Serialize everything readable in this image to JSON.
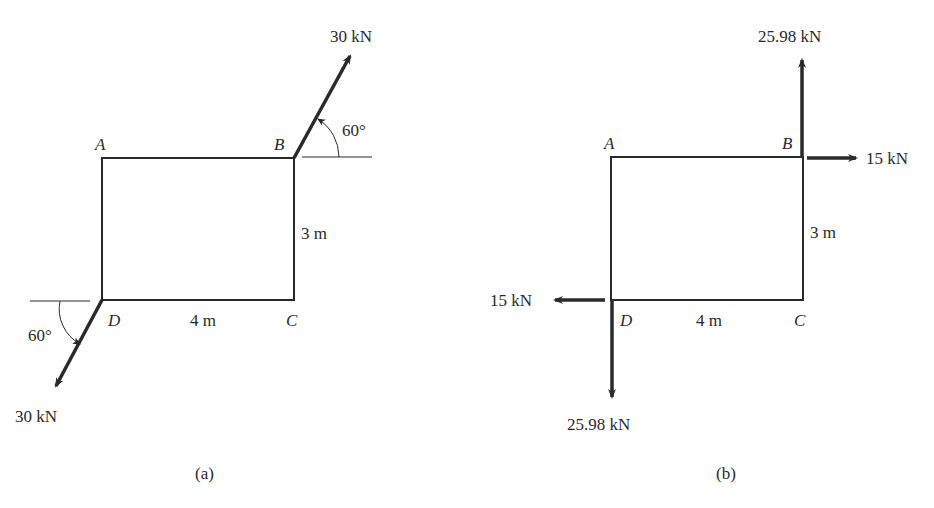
{
  "figures": [
    {
      "caption": "(a)",
      "points": {
        "A": "A",
        "B": "B",
        "C": "C",
        "D": "D"
      },
      "dimensions": {
        "vertical": "3 m",
        "horizontal": "4 m"
      },
      "forces": [
        {
          "at": "B",
          "label": "30 kN",
          "angle_label": "60°",
          "direction": "up-right"
        },
        {
          "at": "D",
          "label": "30 kN",
          "angle_label": "60°",
          "direction": "down-left"
        }
      ]
    },
    {
      "caption": "(b)",
      "points": {
        "A": "A",
        "B": "B",
        "C": "C",
        "D": "D"
      },
      "dimensions": {
        "vertical": "3 m",
        "horizontal": "4 m"
      },
      "forces": [
        {
          "at": "B",
          "label": "25.98 kN",
          "direction": "up"
        },
        {
          "at": "B",
          "label": "15 kN",
          "direction": "right"
        },
        {
          "at": "D",
          "label": "15 kN",
          "direction": "left"
        },
        {
          "at": "D",
          "label": "25.98 kN",
          "direction": "down"
        }
      ]
    }
  ],
  "colors": {
    "line": "#2a2a2a",
    "background": "#ffffff"
  }
}
